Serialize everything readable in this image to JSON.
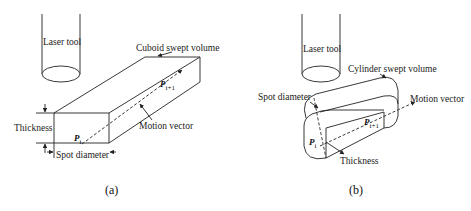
{
  "panel_a": {
    "tool_label": "Laser tool",
    "volume_label": "Cuboid swept volume",
    "thickness_label": "Thickness",
    "spot_label": "Spot diameter",
    "motion_label": "Motion vector",
    "point_start": "P",
    "point_start_sub": "i",
    "point_end": "P",
    "point_end_sub": "i+1",
    "caption": "(a)"
  },
  "panel_b": {
    "tool_label": "Laser tool",
    "volume_label": "Cylinder swept volume",
    "spot_label": "Spot diameter",
    "motion_label": "Motion vector",
    "thickness_label": "Thickness",
    "point_start": "P",
    "point_start_sub": "i",
    "point_end": "P",
    "point_end_sub": "i+1",
    "caption": "(b)"
  },
  "colors": {
    "line": "#222222",
    "background": "#ffffff"
  }
}
